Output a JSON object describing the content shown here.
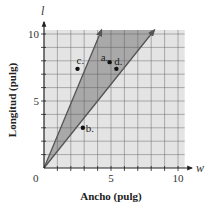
{
  "chart_data": {
    "type": "scatter",
    "title": "",
    "xlabel": "Ancho (pulg)",
    "ylabel": "Longitud (pulg)",
    "x_var": "w",
    "y_var": "l",
    "xlim": [
      0,
      10.5
    ],
    "ylim": [
      0,
      10.3
    ],
    "x_ticks": [
      0,
      5,
      10
    ],
    "y_ticks": [
      5,
      10
    ],
    "origin_label": "0",
    "grid": true,
    "grid_step": 1,
    "points": [
      {
        "label": "a.",
        "w": 4.9,
        "l": 7.9
      },
      {
        "label": "b.",
        "w": 2.9,
        "l": 3.0
      },
      {
        "label": "c.",
        "w": 2.5,
        "l": 7.4
      },
      {
        "label": "d.",
        "w": 5.4,
        "l": 7.4
      }
    ],
    "boundary_rays": [
      {
        "name": "steep",
        "slope": 2.4
      },
      {
        "name": "shallow",
        "slope": 1.25
      }
    ],
    "shaded_region": "between rays l = 1.25w and l = 2.4w",
    "colors": {
      "background": "#e4e4e4",
      "shaded": "#a9a9a9",
      "grid": "#555555",
      "ray": "#555555",
      "point": "#111111"
    }
  }
}
